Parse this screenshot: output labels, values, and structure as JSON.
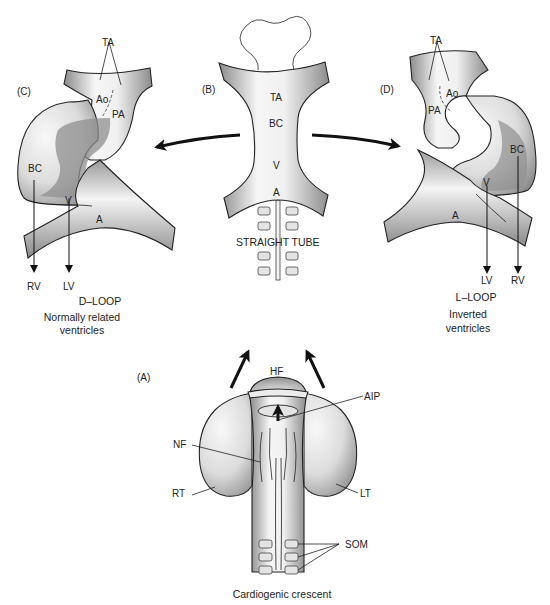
{
  "panels": {
    "A": {
      "tag": "(A)",
      "caption": "Cardiogenic crescent",
      "labels": {
        "hf": "HF",
        "aip": "AIP",
        "nf": "NF",
        "rt": "RT",
        "lt": "LT",
        "som": "SOM"
      }
    },
    "B": {
      "tag": "(B)",
      "caption": "STRAIGHT TUBE",
      "labels": {
        "ta": "TA",
        "bc": "BC",
        "v": "V",
        "a": "A"
      }
    },
    "C": {
      "tag": "(C)",
      "caption_title": "D–LOOP",
      "caption_line1": "Normally related",
      "caption_line2": "ventricles",
      "labels": {
        "ta": "TA",
        "ao": "Ao",
        "pa": "PA",
        "bc": "BC",
        "v": "V",
        "a": "A",
        "rv": "RV",
        "lv": "LV"
      }
    },
    "D": {
      "tag": "(D)",
      "caption_title": "L–LOOP",
      "caption_line1": "Inverted",
      "caption_line2": "ventricles",
      "labels": {
        "ta": "TA",
        "ao": "Ao",
        "pa": "PA",
        "bc": "BC",
        "v": "V",
        "a": "A",
        "lv": "LV",
        "rv": "RV"
      }
    }
  },
  "colors": {
    "tube_light": "#f4f4f4",
    "tube_dark": "#8a8a8a",
    "outline": "#222222"
  }
}
